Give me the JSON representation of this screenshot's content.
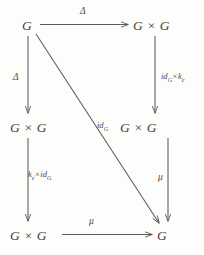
{
  "diagram": {
    "kind": "commutative-diagram",
    "nodes": [
      {
        "id": "top-left",
        "label": "G"
      },
      {
        "id": "top-right",
        "label": "G × G"
      },
      {
        "id": "middle-left",
        "label": "G × G"
      },
      {
        "id": "middle-right",
        "label": "G × G"
      },
      {
        "id": "bottom-left",
        "label": "G × G"
      },
      {
        "id": "bottom-right",
        "label": "G"
      }
    ],
    "edges": [
      {
        "id": "top-horizontal",
        "from": "top-left",
        "to": "top-right",
        "label": "Δ",
        "style": "greek",
        "direction": "right"
      },
      {
        "id": "left-upper-vertical",
        "from": "top-left",
        "to": "middle-left",
        "label": "Δ",
        "style": "greek",
        "direction": "down"
      },
      {
        "id": "right-upper-vertical",
        "from": "top-right",
        "to": "middle-right",
        "label_base_1": "id",
        "label_sub_1": "G",
        "label_op": "×",
        "label_base_2": "k",
        "label_sub_2": "e",
        "style": "map",
        "direction": "down"
      },
      {
        "id": "left-lower-vertical",
        "from": "middle-left",
        "to": "bottom-left",
        "label_base_1": "k",
        "label_sub_1": "e",
        "label_op": "×",
        "label_base_2": "id",
        "label_sub_2": "G",
        "style": "map",
        "direction": "down"
      },
      {
        "id": "right-lower-vertical",
        "from": "middle-right",
        "to": "bottom-right",
        "label": "μ",
        "style": "greek",
        "direction": "down"
      },
      {
        "id": "bottom-horizontal",
        "from": "bottom-left",
        "to": "bottom-right",
        "label": "μ",
        "style": "greek",
        "direction": "right"
      },
      {
        "id": "diagonal",
        "from": "top-left",
        "to": "bottom-right",
        "label_base_1": "id",
        "label_sub_1": "G",
        "style": "map",
        "direction": "down-right"
      }
    ],
    "colors": {
      "background": "#fdfdfc",
      "stroke": "#5a5a5a",
      "text": "#3f3f3f"
    }
  }
}
